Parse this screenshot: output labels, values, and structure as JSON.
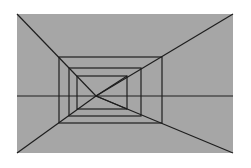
{
  "diagram": {
    "colors": {
      "background": "#ffffff",
      "panel": "#a6a6a6",
      "line": "#1e1e1e"
    },
    "panel": {
      "x": 17,
      "y": 14,
      "w": 216,
      "h": 139
    },
    "vanishing_point": {
      "x": 96,
      "y": 96
    },
    "horizon_y": 96,
    "rectangles": [
      {
        "name": "outer",
        "x1": 59,
        "y1": 57,
        "x2": 162,
        "y2": 123
      },
      {
        "name": "middle",
        "x1": 69,
        "y1": 68,
        "x2": 141,
        "y2": 116
      },
      {
        "name": "inner",
        "x1": 77,
        "y1": 76,
        "x2": 127,
        "y2": 109
      }
    ],
    "diagonals": [
      {
        "from": [
          17,
          14
        ],
        "to": [
          96,
          96
        ]
      },
      {
        "from": [
          233,
          14
        ],
        "to": [
          96,
          96
        ]
      },
      {
        "from": [
          17,
          153
        ],
        "to": [
          96,
          96
        ]
      },
      {
        "from": [
          233,
          153
        ],
        "to": [
          96,
          96
        ]
      }
    ]
  }
}
